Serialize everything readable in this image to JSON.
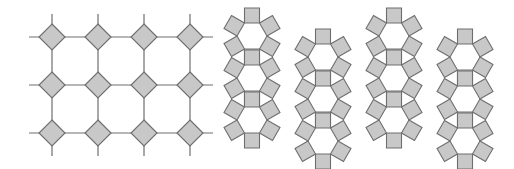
{
  "figure": {
    "width": 514,
    "height": 169,
    "colors": {
      "fill": "#c8c8c8",
      "stroke": "#6e6e6e",
      "line": "#6e6e6e",
      "background": "#ffffff"
    },
    "left_panel": {
      "name": "square-octagon tiling (4.8.8)",
      "diamond_centers_x": [
        52,
        98,
        144,
        190
      ],
      "diamond_centers_y": [
        37,
        85,
        133
      ],
      "diamond_half_diagonal": 13,
      "line_stub": 10
    },
    "right_panel": {
      "name": "rhombitrihexagonal tiling (3.4.6.4)",
      "column_x": [
        252,
        323,
        394,
        465
      ],
      "column_offset_y": [
        0,
        21,
        0,
        21
      ],
      "row_y": [
        36,
        78,
        120
      ],
      "hex_side": 15
    }
  }
}
